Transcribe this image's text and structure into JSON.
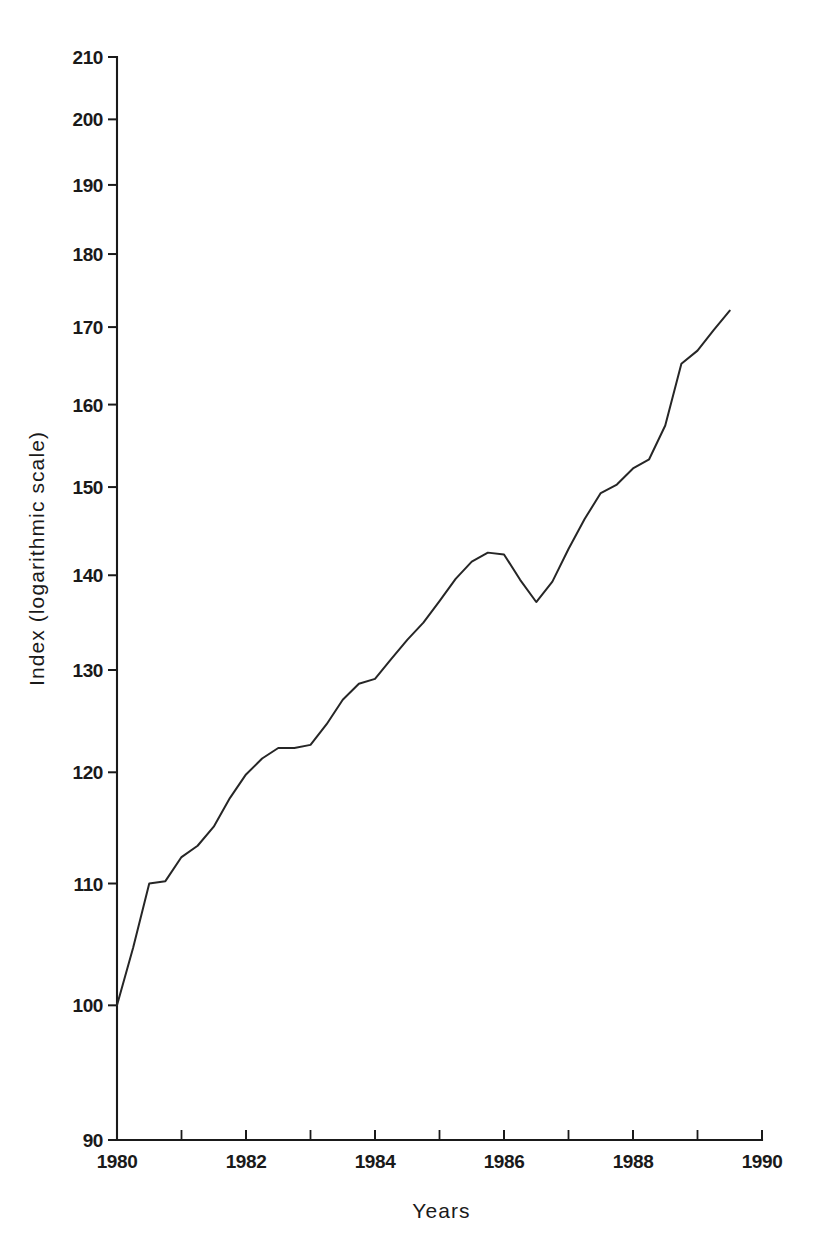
{
  "chart_data": {
    "type": "line",
    "title": "",
    "xlabel": "Years",
    "ylabel": "Index (logarithmic scale)",
    "yscale": "log",
    "xlim": [
      1980,
      1990
    ],
    "ylim": [
      90,
      210
    ],
    "grid": false,
    "legend": false,
    "y_ticks": [
      90,
      100,
      110,
      120,
      130,
      140,
      150,
      160,
      170,
      180,
      190,
      200,
      210
    ],
    "y_tick_labels": [
      "90",
      "100",
      "110",
      "120",
      "130",
      "140",
      "150",
      "160",
      "170",
      "180",
      "190",
      "200",
      "210"
    ],
    "x_ticks": [
      1980,
      1981,
      1982,
      1983,
      1984,
      1985,
      1986,
      1987,
      1988,
      1989,
      1990
    ],
    "x_tick_labels_shown": [
      "1980",
      "1982",
      "1984",
      "1986",
      "1988",
      "1990"
    ],
    "x_labeled_ticks": [
      1980,
      1982,
      1984,
      1986,
      1988,
      1990
    ],
    "series": [
      {
        "name": "Index",
        "color": "#262626",
        "x": [
          1980.0,
          1980.25,
          1980.5,
          1980.75,
          1981.0,
          1981.25,
          1981.5,
          1981.75,
          1982.0,
          1982.25,
          1982.5,
          1982.75,
          1983.0,
          1983.25,
          1983.5,
          1983.75,
          1984.0,
          1984.25,
          1984.5,
          1984.75,
          1985.0,
          1985.25,
          1985.5,
          1985.75,
          1986.0,
          1986.25,
          1986.5,
          1986.75,
          1987.0,
          1987.25,
          1987.5,
          1987.75,
          1988.0,
          1988.25,
          1988.5,
          1988.75,
          1989.0,
          1989.25,
          1989.5
        ],
        "values": [
          100.0,
          104.6,
          110.0,
          110.2,
          112.3,
          113.3,
          115.0,
          117.6,
          119.8,
          121.3,
          122.3,
          122.3,
          122.6,
          124.6,
          127.0,
          128.6,
          129.1,
          131.1,
          133.1,
          134.9,
          137.2,
          139.6,
          141.5,
          142.5,
          142.3,
          139.5,
          137.1,
          139.3,
          142.9,
          146.3,
          149.3,
          150.3,
          152.2,
          153.3,
          157.4,
          165.2,
          166.9,
          169.6,
          172.2
        ]
      }
    ]
  },
  "axis": {
    "y_title": "Index (logarithmic scale)",
    "x_title": "Years"
  }
}
